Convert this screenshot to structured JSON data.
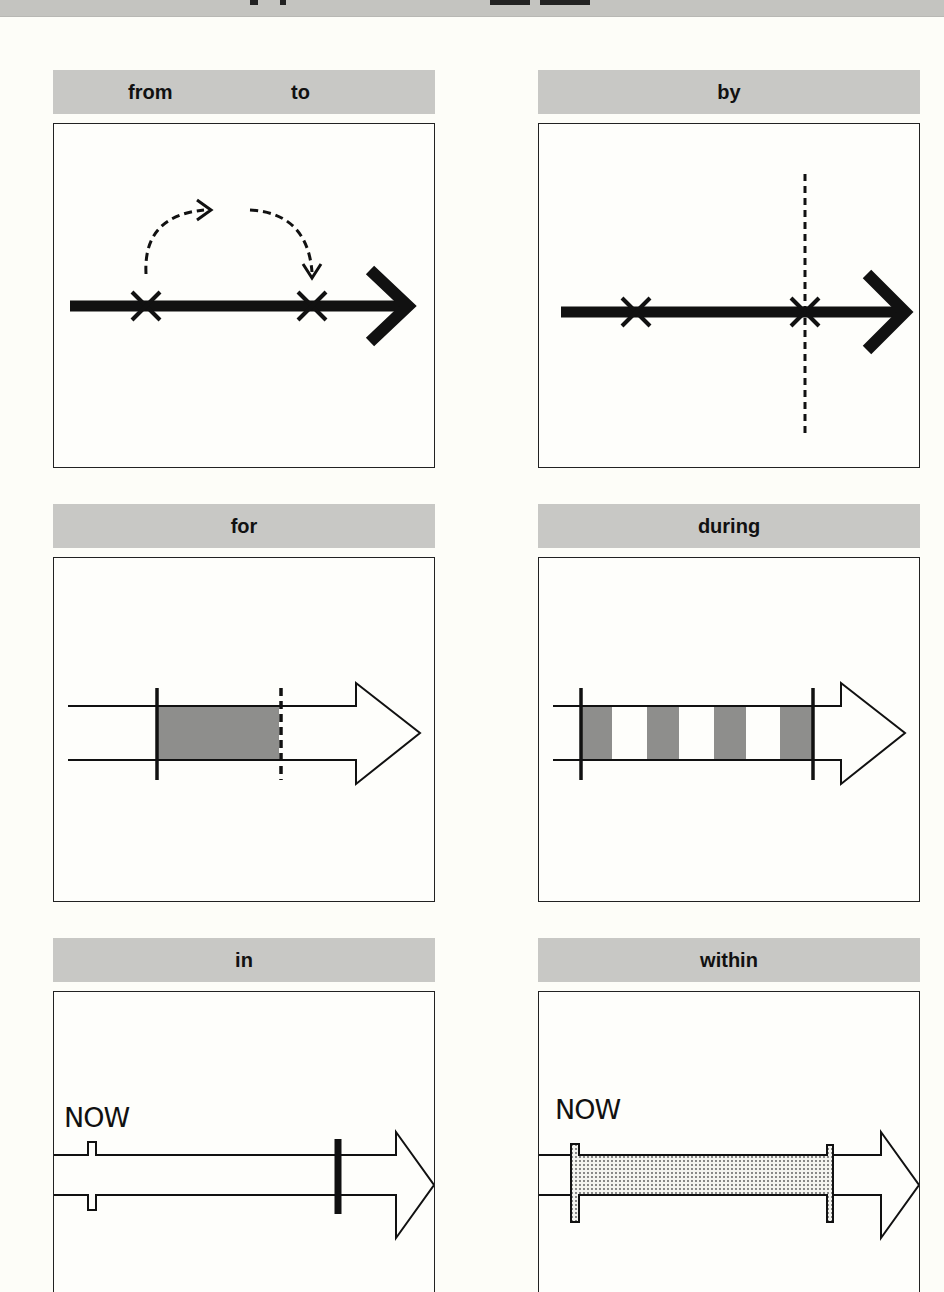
{
  "page": {
    "background": "#fdfdf8",
    "header_gray": "#c8c8c5",
    "ink": "#111111",
    "fill_gray": "#8e8e8c"
  },
  "panels": [
    {
      "id": "from-to",
      "labels": [
        "from",
        "to"
      ],
      "concept": "start and end points on a timeline"
    },
    {
      "id": "by",
      "labels": [
        "by"
      ],
      "concept": "deadline point on a timeline"
    },
    {
      "id": "for",
      "labels": [
        "for"
      ],
      "concept": "duration of a period"
    },
    {
      "id": "during",
      "labels": [
        "during"
      ],
      "concept": "repeated events within a period"
    },
    {
      "id": "in",
      "labels": [
        "in"
      ],
      "now_label": "NOW",
      "concept": "point after a time from now"
    },
    {
      "id": "within",
      "labels": [
        "within"
      ],
      "now_label": "NOW",
      "concept": "period from now until a point"
    }
  ]
}
